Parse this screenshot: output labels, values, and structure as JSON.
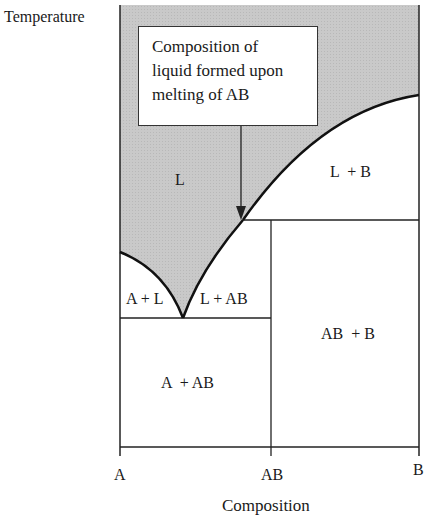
{
  "diagram": {
    "type": "binary phase diagram with congruently melting compound",
    "y_axis_label": "Temperature",
    "x_axis_label": "Composition",
    "x_ticks": [
      "A",
      "AB",
      "B"
    ],
    "callout": {
      "lines": [
        "Composition of",
        "liquid formed upon",
        "melting of AB"
      ]
    },
    "regions": {
      "liquid": "L",
      "liquid_plus_b": "L  + B",
      "a_plus_liquid": "A + L",
      "liquid_plus_ab": "L + AB",
      "ab_plus_b": "AB  + B",
      "a_plus_ab": "A  + AB"
    },
    "colors": {
      "liquid_fill": "#c8c8c8",
      "line": "#222222",
      "background": "#ffffff"
    }
  }
}
